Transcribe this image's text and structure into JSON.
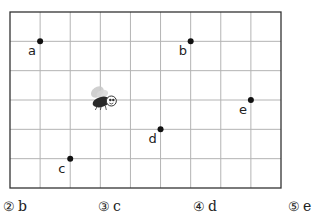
{
  "figure": {
    "grid": {
      "cols": 9,
      "rows": 6,
      "left": 10,
      "top": 12,
      "width": 271,
      "height": 176,
      "line_color": "#b4b4b4",
      "border_color": "#333333"
    },
    "fly": {
      "icon": "fly-icon",
      "col": 3,
      "row": 3
    },
    "points": [
      {
        "label": "a",
        "col": 1,
        "row": 1
      },
      {
        "label": "b",
        "col": 6,
        "row": 1
      },
      {
        "label": "c",
        "col": 2,
        "row": 5
      },
      {
        "label": "d",
        "col": 5,
        "row": 4
      },
      {
        "label": "e",
        "col": 8,
        "row": 3
      }
    ]
  },
  "options": [
    {
      "number": "②",
      "label": "b",
      "x": 3
    },
    {
      "number": "③",
      "label": "c",
      "x": 98
    },
    {
      "number": "④",
      "label": "d",
      "x": 193
    },
    {
      "number": "⑤",
      "label": "e",
      "x": 288
    }
  ]
}
